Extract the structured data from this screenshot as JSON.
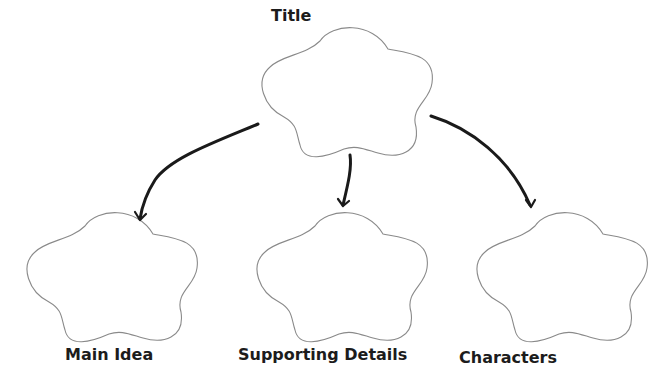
{
  "diagram": {
    "type": "graphic-organizer",
    "root": {
      "label": "Title"
    },
    "children": [
      {
        "label": "Main Idea"
      },
      {
        "label": "Supporting Details"
      },
      {
        "label": "Characters"
      }
    ],
    "colors": {
      "background": "#ffffff",
      "cloud_outline": "#8a8a8a",
      "arrow": "#1a1a1a",
      "label_text": "#1c1c1c"
    },
    "shapes": {
      "node_shape": "five-lobed-cloud",
      "edge_style": "hand-drawn-curved-arrow"
    }
  }
}
